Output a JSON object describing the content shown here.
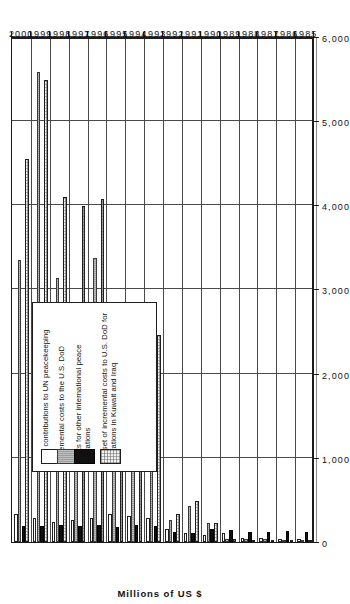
{
  "chart_data": {
    "type": "bar",
    "orientation": "horizontal-rotated",
    "title": "",
    "xlabel": "",
    "ylabel": "Millions of US $",
    "ylim": [
      0,
      6000
    ],
    "yticks": [
      "0",
      "1,000",
      "2,000",
      "3,000",
      "4,000",
      "5,000",
      "6,000"
    ],
    "ytick_values": [
      0,
      1000,
      2000,
      3000,
      4000,
      5000,
      6000
    ],
    "grid": true,
    "legend_position": "inside-lower-left",
    "categories": [
      "1985",
      "1986",
      "1987",
      "1988",
      "1989",
      "1990",
      "1991",
      "1992",
      "1993",
      "1994",
      "1995",
      "1996",
      "1997",
      "1998",
      "1999",
      "2000"
    ],
    "series": [
      {
        "name": "U.S. contributions to UN peacekeeping",
        "key": "s0",
        "swatch": "white-outline",
        "color": "#ffffff",
        "values": [
          30,
          40,
          45,
          50,
          110,
          80,
          110,
          160,
          280,
          310,
          330,
          290,
          260,
          240,
          280,
          330
        ]
      },
      {
        "name": "Incremental costs to the U.S. DoD",
        "key": "s1",
        "swatch": "grey",
        "color": "#9d9d9d",
        "values": [
          20,
          25,
          30,
          30,
          40,
          230,
          430,
          260,
          1260,
          1250,
          1320,
          3380,
          2760,
          3140,
          5580,
          3350
        ]
      },
      {
        "name": "Costs for other international peace operations",
        "key": "s2",
        "swatch": "black",
        "color": "#101010",
        "values": [
          120,
          130,
          120,
          120,
          140,
          150,
          110,
          120,
          190,
          200,
          180,
          200,
          190,
          200,
          190,
          190
        ]
      },
      {
        "name": "Subset of incremental costs to U.S. DoD for operations in Kuwait and Iraq",
        "key": "s3",
        "swatch": "dotted-outline",
        "color": "#f2f2f2",
        "values": [
          10,
          20,
          20,
          20,
          30,
          220,
          490,
          330,
          2460,
          1910,
          1990,
          4080,
          3990,
          4100,
          5490,
          4550
        ]
      }
    ]
  },
  "legend": {
    "items": [
      {
        "label": "U.S. contributions to UN peacekeeping",
        "swatch": "white-outline"
      },
      {
        "label": "Incremental costs to the U.S. DoD",
        "swatch": "grey"
      },
      {
        "label": "Costs for other international peace operations",
        "swatch": "black"
      },
      {
        "label": "Subset of incremental costs to U.S. DoD for operations in Kuwait and Iraq",
        "swatch": "dotted-outline"
      }
    ]
  }
}
